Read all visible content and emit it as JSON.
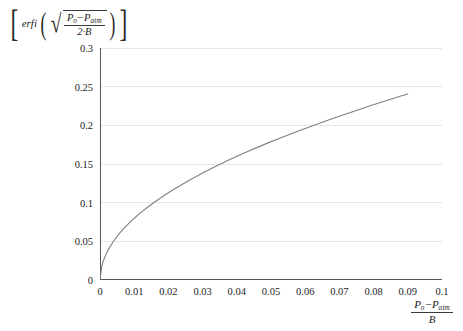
{
  "chart_data": {
    "type": "line",
    "title": "",
    "subtitle": "",
    "ylabel_text": "[ erfi( sqrt( (P_o - P_atm) / (2*B) ) ) ]",
    "xlabel_text": "(P_o - P_atm) / B",
    "ylabel_parts": {
      "open_bracket": "[",
      "function": "erfi",
      "open_paren": "(",
      "radical": "√",
      "numerator_var1": "P",
      "numerator_sub1": "o",
      "numerator_minus": "−",
      "numerator_var2": "P",
      "numerator_sub2": "atm",
      "denominator": "2·B",
      "close_paren": ")",
      "close_bracket": "]"
    },
    "xlabel_parts": {
      "numerator_var1": "P",
      "numerator_sub1": "o",
      "numerator_minus": "−",
      "numerator_var2": "P",
      "numerator_sub2": "atm",
      "denominator": "B"
    },
    "xlim": [
      0,
      0.1
    ],
    "ylim": [
      0,
      0.3
    ],
    "xticks": [
      0,
      0.01,
      0.02,
      0.03,
      0.04,
      0.05,
      0.06,
      0.07,
      0.08,
      0.09,
      0.1
    ],
    "xtick_labels": [
      "0",
      "0.01",
      "0.02",
      "0.03",
      "0.04",
      "0.05",
      "0.06",
      "0.07",
      "0.08",
      "0.09",
      "0.1"
    ],
    "yticks": [
      0,
      0.05,
      0.1,
      0.15,
      0.2,
      0.25,
      0.3
    ],
    "ytick_labels": [
      "0",
      "0.05",
      "0.1",
      "0.15",
      "0.2",
      "0.25",
      "0.3"
    ],
    "grid": {
      "horizontal": true,
      "vertical": false,
      "color": "#e6e6e6"
    },
    "legend": null,
    "series": [
      {
        "name": "erfi(sqrt(x/2))",
        "color": "#808080",
        "linewidth": 1.1,
        "x": [
          0,
          0.0005,
          0.001,
          0.002,
          0.003,
          0.004,
          0.005,
          0.006,
          0.007,
          0.008,
          0.009,
          0.01,
          0.012,
          0.014,
          0.016,
          0.018,
          0.02,
          0.022,
          0.024,
          0.026,
          0.028,
          0.03,
          0.032,
          0.034,
          0.036,
          0.038,
          0.04,
          0.043,
          0.046,
          0.049,
          0.052,
          0.055,
          0.058,
          0.061,
          0.064,
          0.067,
          0.07,
          0.073,
          0.076,
          0.079,
          0.082,
          0.085,
          0.088,
          0.09
        ],
        "y": [
          0,
          0.0178,
          0.0252,
          0.0357,
          0.0437,
          0.0504,
          0.0564,
          0.0618,
          0.0667,
          0.0713,
          0.0757,
          0.0798,
          0.0874,
          0.0944,
          0.1009,
          0.107,
          0.1128,
          0.1183,
          0.1236,
          0.1287,
          0.1336,
          0.1383,
          0.1428,
          0.1473,
          0.1516,
          0.1558,
          0.1599,
          0.1658,
          0.1715,
          0.177,
          0.1824,
          0.1876,
          0.1927,
          0.1976,
          0.2025,
          0.2072,
          0.2118,
          0.2164,
          0.2208,
          0.2252,
          0.2294,
          0.2336,
          0.2378,
          0.2405
        ]
      }
    ],
    "axis_color": "#555555",
    "tick_color": "#555555",
    "curve_endpoint": {
      "x": 0.09,
      "y": 0.2405
    }
  }
}
